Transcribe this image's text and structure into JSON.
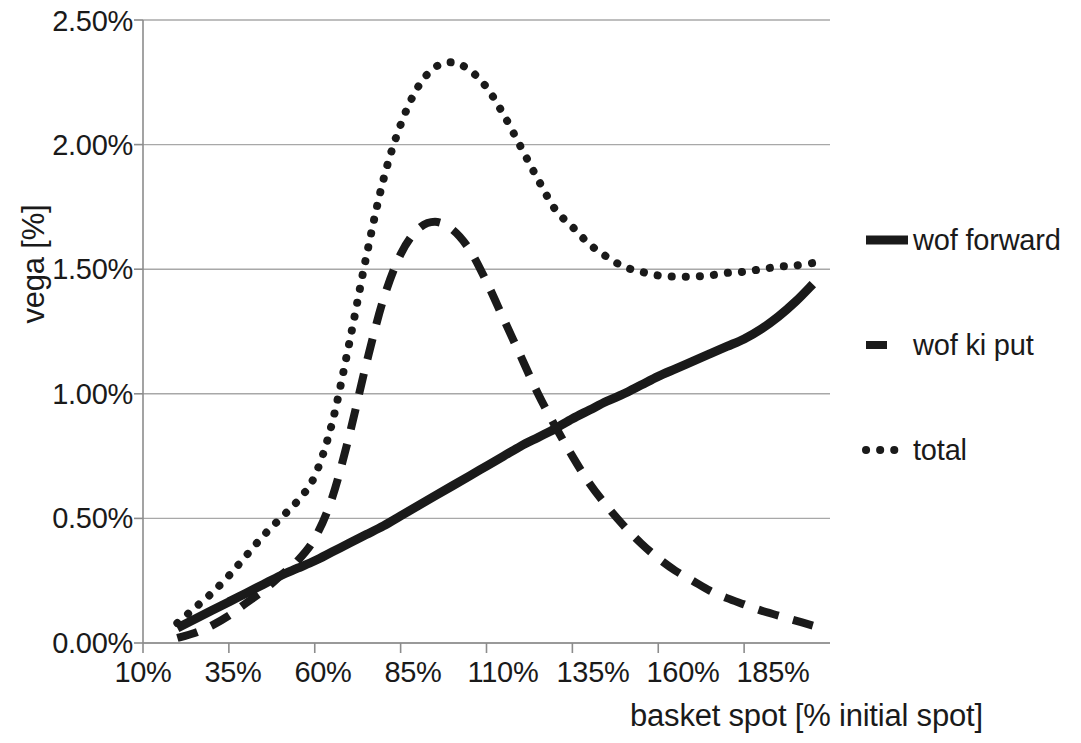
{
  "chart_data": {
    "type": "line",
    "title": "",
    "xlabel": "basket spot [% initial spot]",
    "ylabel": "vega [%]",
    "xlim": [
      10,
      210
    ],
    "ylim": [
      0.0,
      2.5
    ],
    "xticks": [
      "10%",
      "35%",
      "60%",
      "85%",
      "110%",
      "135%",
      "160%",
      "185%"
    ],
    "xtick_values": [
      10,
      35,
      60,
      85,
      110,
      135,
      160,
      185
    ],
    "yticks": [
      "0.00%",
      "0.50%",
      "1.00%",
      "1.50%",
      "2.00%",
      "2.50%"
    ],
    "ytick_values": [
      0.0,
      0.5,
      1.0,
      1.5,
      2.0,
      2.5
    ],
    "grid": "horizontal",
    "legend_position": "right",
    "x": [
      20,
      25,
      30,
      35,
      40,
      45,
      50,
      55,
      60,
      65,
      70,
      75,
      80,
      85,
      90,
      95,
      100,
      105,
      110,
      115,
      120,
      125,
      130,
      135,
      140,
      145,
      150,
      155,
      160,
      165,
      170,
      175,
      180,
      185,
      190,
      195,
      200,
      205
    ],
    "series": [
      {
        "name": "wof forward",
        "style": "solid",
        "color": "#1a1a1a",
        "values": [
          0.06,
          0.095,
          0.13,
          0.165,
          0.2,
          0.235,
          0.27,
          0.3,
          0.33,
          0.365,
          0.4,
          0.435,
          0.47,
          0.51,
          0.55,
          0.59,
          0.63,
          0.67,
          0.71,
          0.75,
          0.79,
          0.825,
          0.86,
          0.9,
          0.935,
          0.97,
          1.0,
          1.035,
          1.07,
          1.1,
          1.13,
          1.16,
          1.19,
          1.22,
          1.26,
          1.31,
          1.37,
          1.44
        ]
      },
      {
        "name": "wof ki put",
        "style": "dashed",
        "color": "#1a1a1a",
        "values": [
          0.02,
          0.04,
          0.07,
          0.11,
          0.16,
          0.21,
          0.27,
          0.33,
          0.42,
          0.58,
          0.83,
          1.12,
          1.38,
          1.56,
          1.66,
          1.69,
          1.66,
          1.58,
          1.45,
          1.3,
          1.15,
          1.0,
          0.87,
          0.75,
          0.64,
          0.55,
          0.47,
          0.4,
          0.34,
          0.29,
          0.25,
          0.21,
          0.18,
          0.155,
          0.13,
          0.11,
          0.09,
          0.07
        ]
      },
      {
        "name": "total",
        "style": "dotted",
        "color": "#1a1a1a",
        "values": [
          0.08,
          0.14,
          0.2,
          0.27,
          0.35,
          0.43,
          0.5,
          0.57,
          0.67,
          0.88,
          1.2,
          1.55,
          1.86,
          2.08,
          2.23,
          2.31,
          2.33,
          2.3,
          2.23,
          2.12,
          1.99,
          1.86,
          1.74,
          1.67,
          1.6,
          1.55,
          1.51,
          1.49,
          1.475,
          1.47,
          1.47,
          1.475,
          1.485,
          1.49,
          1.5,
          1.51,
          1.515,
          1.525
        ]
      }
    ]
  },
  "axis": {
    "ylabel_text": "vega [%]",
    "xlabel_text": "basket spot [% initial spot]",
    "yticks": {
      "t0": "0.00%",
      "t1": "0.50%",
      "t2": "1.00%",
      "t3": "1.50%",
      "t4": "2.00%",
      "t5": "2.50%"
    },
    "xticks": {
      "t0": "10%",
      "t1": "35%",
      "t2": "60%",
      "t3": "85%",
      "t4": "110%",
      "t5": "135%",
      "t6": "160%",
      "t7": "185%"
    }
  },
  "legend": {
    "entries": [
      {
        "label": "wof forward",
        "style": "solid"
      },
      {
        "label": "wof ki put",
        "style": "dashed"
      },
      {
        "label": "total",
        "style": "dotted"
      }
    ]
  },
  "colors": {
    "ink": "#1a1a1a",
    "grid": "#a8a8a8",
    "axis": "#8c8c8c",
    "background": "#ffffff"
  }
}
